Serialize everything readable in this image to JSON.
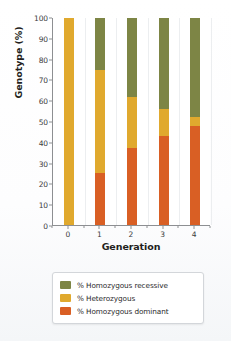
{
  "chart_data": {
    "type": "bar",
    "subtype": "stacked-100-percent",
    "title": "",
    "xlabel": "Generation",
    "ylabel": "Genotype (%)",
    "categories": [
      "0",
      "1",
      "2",
      "3",
      "4"
    ],
    "x": [
      0,
      1,
      2,
      3,
      4
    ],
    "ylim": [
      0,
      100
    ],
    "yticks": [
      0,
      10,
      20,
      30,
      40,
      50,
      60,
      70,
      80,
      90,
      100
    ],
    "ytick_labels": [
      "0",
      "10",
      "20",
      "30",
      "40",
      "50",
      "60",
      "70",
      "80",
      "90",
      "100"
    ],
    "grid": "vertical-only",
    "legend_position": "bottom",
    "series": [
      {
        "name": "% Homozygous recessive",
        "color": "#7d8545",
        "values": [
          0,
          25,
          38,
          44,
          48
        ]
      },
      {
        "name": "% Heterozygous",
        "color": "#e0a92e",
        "values": [
          100,
          50,
          25,
          13,
          4
        ]
      },
      {
        "name": "% Homozygous dominant",
        "color": "#d95f24",
        "values": [
          0,
          25,
          37,
          43,
          48
        ]
      }
    ],
    "stack_order_bottom_to_top": [
      "% Homozygous dominant",
      "% Heterozygous",
      "% Homozygous recessive"
    ]
  },
  "axes": {
    "ylabel": "Genotype (%)",
    "xlabel": "Generation",
    "ytick_labels": [
      "100",
      "90",
      "80",
      "70",
      "60",
      "50",
      "40",
      "30",
      "20",
      "10",
      "0"
    ],
    "xtick_labels": [
      "0",
      "1",
      "2",
      "3",
      "4"
    ]
  },
  "legend": {
    "items": [
      {
        "label": "% Homozygous recessive",
        "color": "#7d8545"
      },
      {
        "label": "% Heterozygous",
        "color": "#e0a92e"
      },
      {
        "label": "% Homozygous dominant",
        "color": "#d95f24"
      }
    ]
  }
}
